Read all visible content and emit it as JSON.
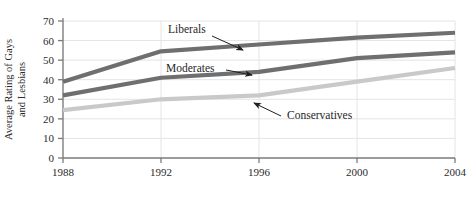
{
  "chart_data": {
    "type": "line",
    "title": "",
    "xlabel": "",
    "ylabel": "Average Rating of Gays and Lesbians",
    "ylabel_line1": "Average Rating of Gays",
    "ylabel_line2": "and Lesbians",
    "x": [
      1988,
      1992,
      1996,
      2000,
      2004
    ],
    "xtick_labels": [
      "1988",
      "1992",
      "1996",
      "2000",
      "2004"
    ],
    "ytick_labels": [
      "0",
      "10",
      "20",
      "30",
      "40",
      "50",
      "60",
      "70"
    ],
    "yticks": [
      0,
      10,
      20,
      30,
      40,
      50,
      60,
      70
    ],
    "ylim": [
      0,
      70
    ],
    "xlim": [
      1988,
      2004
    ],
    "grid": "both",
    "legend": "inline-annotations",
    "series": [
      {
        "name": "Liberals",
        "label": "Liberals",
        "color": "#6f6f6f",
        "values": [
          39,
          54.5,
          58,
          61.5,
          64
        ]
      },
      {
        "name": "Moderates",
        "label": "Moderates",
        "color": "#6f6f6f",
        "values": [
          32,
          41,
          44,
          51,
          54
        ]
      },
      {
        "name": "Conservatives",
        "label": "Conservatives",
        "color": "#c9c9c9",
        "values": [
          24.5,
          30,
          32,
          39,
          46
        ]
      }
    ],
    "annotations": [
      {
        "text": "Liberals",
        "target_series": "Liberals"
      },
      {
        "text": "Moderates",
        "target_series": "Moderates"
      },
      {
        "text": "Conservatives",
        "target_series": "Conservatives"
      }
    ]
  },
  "colors": {
    "axis": "#7a7a7a",
    "grid": "#e4e4e4",
    "text": "#2b2b2b",
    "dark_series": "#6f6f6f",
    "light_series": "#c9c9c9",
    "background": "#ffffff"
  }
}
